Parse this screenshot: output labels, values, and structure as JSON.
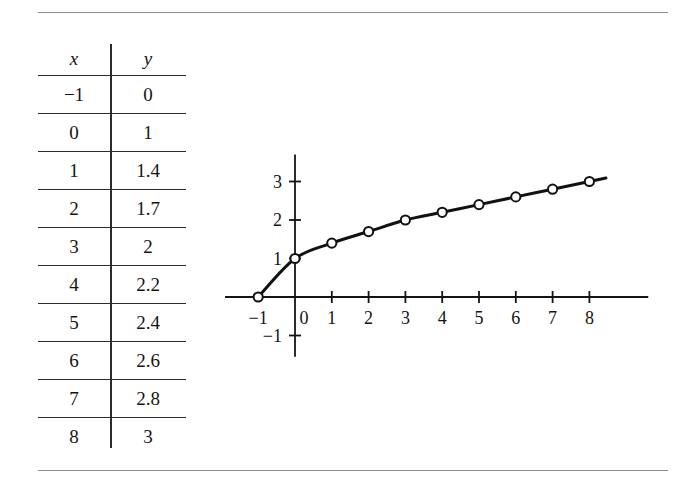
{
  "figure": {
    "background_color": "#ffffff",
    "rule_color": "#8d8d8d",
    "ink_color": "#121212"
  },
  "table": {
    "headers": [
      "x",
      "y"
    ],
    "rows": [
      {
        "x": "−1",
        "y": "0"
      },
      {
        "x": "0",
        "y": "1"
      },
      {
        "x": "1",
        "y": "1.4"
      },
      {
        "x": "2",
        "y": "1.7"
      },
      {
        "x": "3",
        "y": "2"
      },
      {
        "x": "4",
        "y": "2.2"
      },
      {
        "x": "5",
        "y": "2.4"
      },
      {
        "x": "6",
        "y": "2.6"
      },
      {
        "x": "7",
        "y": "2.8"
      },
      {
        "x": "8",
        "y": "3"
      }
    ]
  },
  "chart_data": {
    "type": "line",
    "title": "",
    "xlabel": "x",
    "ylabel": "y",
    "x": [
      -1,
      0,
      1,
      2,
      3,
      4,
      5,
      6,
      7,
      8
    ],
    "values": [
      0,
      1,
      1.4,
      1.7,
      2,
      2.2,
      2.4,
      2.6,
      2.8,
      3
    ],
    "series": [
      {
        "name": "",
        "x": [
          -1,
          0,
          1,
          2,
          3,
          4,
          5,
          6,
          7,
          8
        ],
        "values": [
          0,
          1,
          1.4,
          1.7,
          2,
          2.2,
          2.4,
          2.6,
          2.8,
          3
        ]
      }
    ],
    "xlim": [
      -1.9,
      9.6
    ],
    "ylim": [
      -1.55,
      3.7
    ],
    "xticks": [
      1,
      2,
      3,
      4,
      5,
      6,
      7,
      8
    ],
    "xtick_labels": [
      "1",
      "2",
      "3",
      "4",
      "5",
      "6",
      "7",
      "8"
    ],
    "yticks": [
      -1,
      1,
      2,
      3
    ],
    "ytick_labels": [
      "−1",
      "1",
      "2",
      "3"
    ],
    "origin_label": "0",
    "negative_one_x_label": "−1",
    "grid": false,
    "legend": "none",
    "marker": "open-circle",
    "marker_fill": "#ffffff",
    "line_color": "#111111",
    "line_width": 3,
    "curve_extends_past_last_point": true
  }
}
